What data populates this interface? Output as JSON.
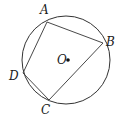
{
  "diagram": {
    "type": "inscribed-quadrilateral",
    "stroke_color": "#333333",
    "circle": {
      "center_label": "O",
      "cx": 66,
      "cy": 60,
      "r": 44
    },
    "points": [
      {
        "label": "A",
        "x": 47,
        "y": 22,
        "lx": 40,
        "ly": 14
      },
      {
        "label": "B",
        "x": 103,
        "y": 43,
        "lx": 106,
        "ly": 46
      },
      {
        "label": "C",
        "x": 49,
        "y": 100,
        "lx": 41,
        "ly": 114
      },
      {
        "label": "D",
        "x": 23,
        "y": 73,
        "lx": 9,
        "ly": 80
      }
    ],
    "center_dot": {
      "x": 68,
      "y": 60
    },
    "center_label_pos": {
      "x": 57,
      "y": 64
    }
  }
}
